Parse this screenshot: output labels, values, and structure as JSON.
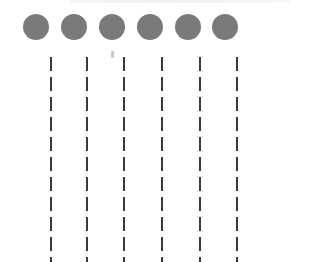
{
  "diagram": {
    "type": "lifelines",
    "colors": {
      "node": "#7a7a7a",
      "line": "#3a3a3a",
      "background": "#ffffff"
    },
    "nodes": [
      {
        "id": "n1",
        "cx": 36
      },
      {
        "id": "n2",
        "cx": 74
      },
      {
        "id": "n3",
        "cx": 112
      },
      {
        "id": "n4",
        "cx": 150
      },
      {
        "id": "n5",
        "cx": 188
      },
      {
        "id": "n6",
        "cx": 225
      }
    ],
    "lifelines": [
      {
        "id": "l1",
        "x": 51
      },
      {
        "id": "l2",
        "x": 87
      },
      {
        "id": "l3",
        "x": 124
      },
      {
        "id": "l4",
        "x": 162
      },
      {
        "id": "l5",
        "x": 200
      },
      {
        "id": "l6",
        "x": 237
      }
    ],
    "dash": {
      "length": 14,
      "gap": 6
    }
  }
}
